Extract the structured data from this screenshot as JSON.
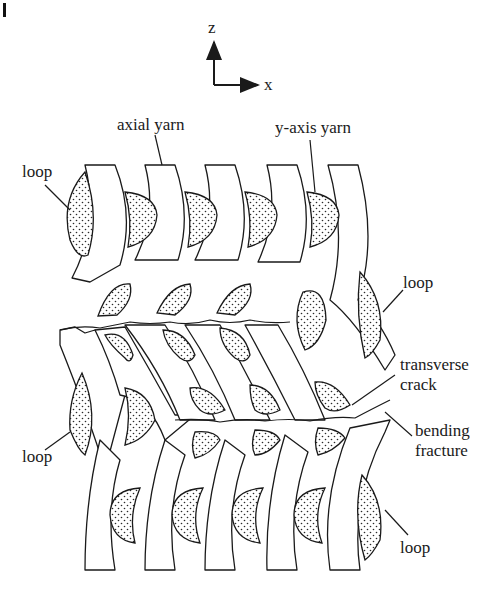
{
  "figure": {
    "axes": {
      "vertical_label": "z",
      "horizontal_label": "x"
    },
    "labels": {
      "axial_yarn": "axial yarn",
      "y_axis_yarn": "y-axis yarn",
      "loop_top_left": "loop",
      "loop_top_right": "loop",
      "loop_bottom_left": "loop",
      "loop_bottom_right": "loop",
      "transverse_crack_line1": "transverse",
      "transverse_crack_line2": "crack",
      "bending_fracture_line1": "bending",
      "bending_fracture_line2": "fracture"
    },
    "colors": {
      "ink": "#1a1a1a",
      "background": "#ffffff",
      "stipple": "#2a2a2a"
    }
  }
}
